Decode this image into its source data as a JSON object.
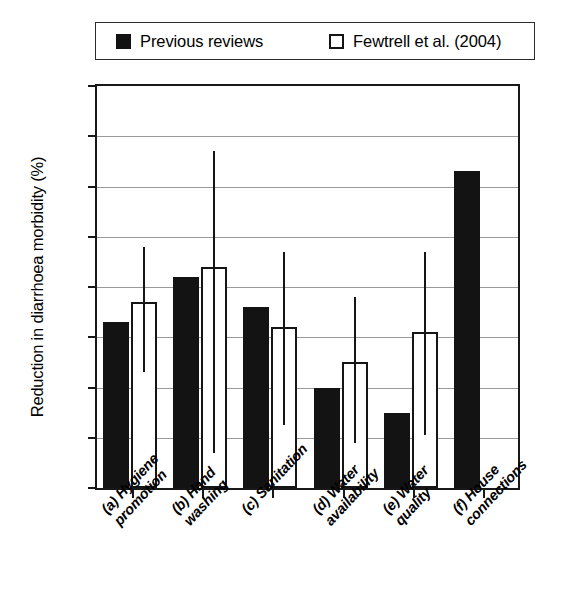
{
  "legend": {
    "entries": [
      {
        "label": "Previous reviews",
        "swatch": "filled-square-icon",
        "color": "#131313"
      },
      {
        "label": "Fewtrell et al. (2004)",
        "swatch": "hollow-square-icon",
        "color": "#ffffff"
      }
    ]
  },
  "axes": {
    "ylabel": "Reduction in diarrhoea morbidity (%)",
    "yticks": [
      "0",
      "10",
      "20",
      "30",
      "40",
      "50",
      "60",
      "70",
      "80"
    ],
    "xlabels": [
      {
        "line1": "(a) Hygiene",
        "line2": "promotion"
      },
      {
        "line1": "(b) Hand",
        "line2": "washing"
      },
      {
        "line1": "(c) Sanitation",
        "line2": ""
      },
      {
        "line1": "(d) Water",
        "line2": "availability"
      },
      {
        "line1": "(e) Water",
        "line2": "quality"
      },
      {
        "line1": "(f) House",
        "line2": "connections"
      }
    ]
  },
  "chart_data": {
    "type": "bar",
    "title": "",
    "xlabel": "",
    "ylabel": "Reduction in diarrhoea morbidity (%)",
    "ylim": [
      0,
      80
    ],
    "ytick_interval": 10,
    "grid": true,
    "legend_position": "top",
    "categories": [
      "(a) Hygiene promotion",
      "(b) Hand washing",
      "(c) Sanitation",
      "(d) Water availability",
      "(e) Water quality",
      "(f) House connections"
    ],
    "series": [
      {
        "name": "Previous reviews",
        "style": "filled",
        "color": "#131313",
        "values": [
          33,
          42,
          36,
          20,
          15,
          63
        ]
      },
      {
        "name": "Fewtrell et al. (2004)",
        "style": "hollow",
        "color": "#ffffff",
        "values": [
          37,
          44,
          32,
          25,
          31,
          null
        ],
        "error_low": [
          23,
          7,
          12.5,
          9,
          10.5,
          null
        ],
        "error_high": [
          48,
          67,
          47,
          38,
          47,
          null
        ]
      }
    ]
  }
}
